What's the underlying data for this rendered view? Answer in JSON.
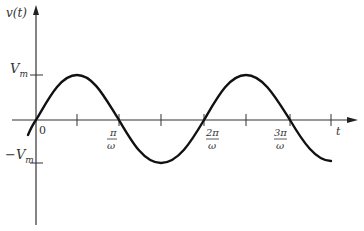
{
  "figure": {
    "type": "sinusoid",
    "y_axis_label": "v(t)",
    "x_axis_label": "t",
    "amplitude_label": "V",
    "amplitude_sub": "m",
    "neg_amplitude_label": "−V",
    "neg_amplitude_sub": "m",
    "origin_label": "0",
    "tick_labels": [
      {
        "num": "π",
        "den": "ω"
      },
      {
        "num": "2π",
        "den": "ω"
      },
      {
        "num": "3π",
        "den": "ω"
      }
    ],
    "colors": {
      "curve": "#111111",
      "axis": "#333333",
      "background": "#ffffff"
    }
  }
}
